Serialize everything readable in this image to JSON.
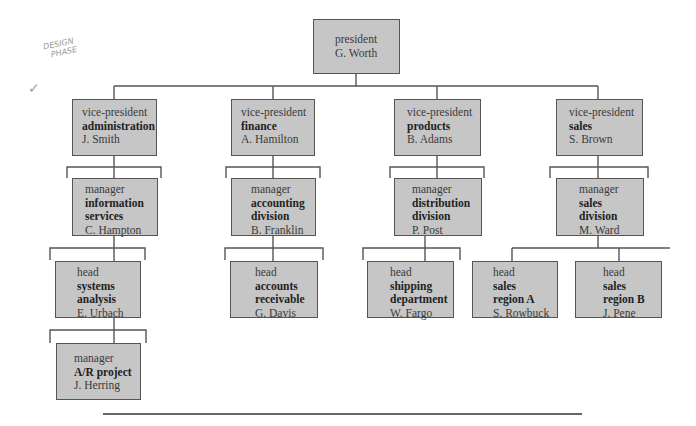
{
  "annotation": {
    "handwritten_note_line1": "DESIGN",
    "handwritten_note_line2": "PHASE",
    "checkmark_icon": "checkmark"
  },
  "president": {
    "title": "president",
    "name": "G. Worth"
  },
  "vps": [
    {
      "title": "vice-president",
      "dept": "administration",
      "name": "J. Smith"
    },
    {
      "title": "vice-president",
      "dept": "finance",
      "name": "A. Hamilton"
    },
    {
      "title": "vice-president",
      "dept": "products",
      "name": "B. Adams"
    },
    {
      "title": "vice-president",
      "dept": "sales",
      "name": "S. Brown"
    }
  ],
  "managers": [
    {
      "title": "manager",
      "dept1": "information",
      "dept2": "services",
      "name": "C. Hampton"
    },
    {
      "title": "manager",
      "dept1": "accounting",
      "dept2": "division",
      "name": "B. Franklin"
    },
    {
      "title": "manager",
      "dept1": "distribution",
      "dept2": "division",
      "name": "P. Post"
    },
    {
      "title": "manager",
      "dept1": "sales",
      "dept2": "division",
      "name": "M. Ward"
    }
  ],
  "heads": [
    {
      "title": "head",
      "dept1": "systems",
      "dept2": "analysis",
      "name": "E. Urbach"
    },
    {
      "title": "head",
      "dept1": "accounts",
      "dept2": "receivable",
      "name": "G. Davis"
    },
    {
      "title": "head",
      "dept1": "shipping",
      "dept2": "department",
      "name": "W. Fargo"
    },
    {
      "title": "head",
      "dept1": "sales",
      "dept2": "region A",
      "name": "S. Rowbuck"
    },
    {
      "title": "head",
      "dept1": "sales",
      "dept2": "region B",
      "name": "J. Pene"
    }
  ],
  "project_manager": {
    "title": "manager",
    "dept": "A/R project",
    "name": "J. Herring"
  }
}
